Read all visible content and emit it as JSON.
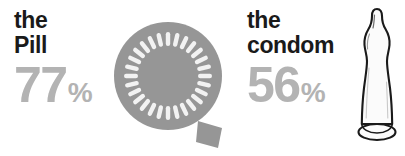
{
  "chart_data": {
    "type": "bar",
    "title": "",
    "subtitle": "",
    "xlabel": "",
    "ylabel": "",
    "unit": "%",
    "categories": [
      "the Pill",
      "the condom"
    ],
    "values": [
      77,
      56
    ],
    "ylim": [
      0,
      100
    ],
    "grid": false,
    "legend": "none",
    "annotations": [
      "the Pill 77%",
      "the condom 56%"
    ]
  },
  "colors": {
    "label_text": "#1a1a1a",
    "percent_text": "#b3b3b3",
    "pillpack_fill": "#969696",
    "pillpack_slot": "#f2f2f2",
    "condom_outline": "#1a1a1a",
    "condom_fill": "#fbfbfb",
    "background": "#ffffff"
  },
  "items": [
    {
      "id": "pill",
      "label_line_1": "the",
      "label_line_2": "Pill",
      "percent_value": "77",
      "percent_sign": "%",
      "icon": "pill-pack-icon",
      "slot_count": 28
    },
    {
      "id": "condom",
      "label_line_1": "the",
      "label_line_2": "condom",
      "percent_value": "56",
      "percent_sign": "%",
      "icon": "condom-icon"
    }
  ]
}
